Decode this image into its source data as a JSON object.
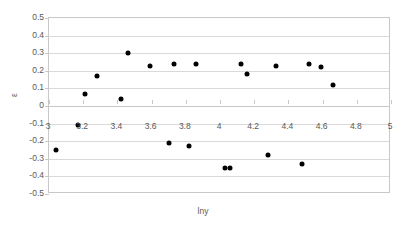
{
  "chart_data": {
    "type": "scatter",
    "title": "",
    "xlabel": "lny",
    "ylabel": "ε",
    "xlim": [
      3,
      5
    ],
    "ylim": [
      -0.5,
      0.5
    ],
    "xticks": [
      3,
      3.2,
      3.4,
      3.6,
      3.8,
      4,
      4.2,
      4.4,
      4.6,
      4.8,
      5
    ],
    "xticklabels": [
      "3",
      "3.2",
      "3.4",
      "3.6",
      "3.8",
      "4",
      "4.2",
      "4.4",
      "4.6",
      "4.8",
      "5"
    ],
    "yticks": [
      0.5,
      0.4,
      0.3,
      0.2,
      0.1,
      0,
      -0.1,
      -0.2,
      -0.3,
      -0.4,
      -0.5
    ],
    "yticklabels": [
      "0.5",
      "0.4",
      "0.3",
      "0.2",
      "0.1",
      "0",
      "-0.1",
      "-0.2",
      "-0.3",
      "-0.4",
      "-0.5"
    ],
    "grid": "horizontal",
    "legend": "none",
    "marker": {
      "shape": "circle",
      "color": "#000000",
      "size": 5
    },
    "points": [
      {
        "x": 3.04,
        "y": -0.25
      },
      {
        "x": 3.17,
        "y": -0.11
      },
      {
        "x": 3.21,
        "y": 0.07
      },
      {
        "x": 3.28,
        "y": 0.17
      },
      {
        "x": 3.42,
        "y": 0.04
      },
      {
        "x": 3.46,
        "y": 0.3
      },
      {
        "x": 3.59,
        "y": 0.23
      },
      {
        "x": 3.7,
        "y": -0.21
      },
      {
        "x": 3.73,
        "y": 0.24
      },
      {
        "x": 3.82,
        "y": -0.23
      },
      {
        "x": 3.86,
        "y": 0.24
      },
      {
        "x": 4.03,
        "y": -0.35
      },
      {
        "x": 4.06,
        "y": -0.35
      },
      {
        "x": 4.12,
        "y": 0.24
      },
      {
        "x": 4.16,
        "y": 0.18
      },
      {
        "x": 4.28,
        "y": -0.28
      },
      {
        "x": 4.33,
        "y": 0.23
      },
      {
        "x": 4.48,
        "y": -0.33
      },
      {
        "x": 4.52,
        "y": 0.24
      },
      {
        "x": 4.59,
        "y": 0.22
      },
      {
        "x": 4.66,
        "y": 0.12
      }
    ]
  }
}
